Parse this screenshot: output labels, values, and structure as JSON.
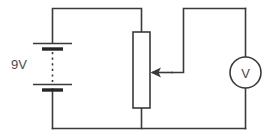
{
  "diagram": {
    "background_color": "#ffffff",
    "line_color": "#3a3a3a",
    "text_color": "#4a4a4a",
    "width": 275,
    "height": 139
  },
  "components": {
    "battery": {
      "name": "battery",
      "label": "9V",
      "symbol": "multi-cell-battery",
      "cells": 2
    },
    "potentiometer": {
      "name": "potentiometer",
      "label": "",
      "symbol": "rectangular-resistor-with-wiper",
      "wiper_direction": "left"
    },
    "voltmeter": {
      "name": "voltmeter",
      "label": "V",
      "symbol": "circle-meter"
    }
  },
  "wires": [
    {
      "name": "top-left-wire",
      "from": "battery-positive",
      "to": "potentiometer-top"
    },
    {
      "name": "wiper-wire",
      "from": "potentiometer-wiper",
      "to": "voltmeter-top"
    },
    {
      "name": "bottom-wire",
      "from": "battery-negative",
      "to": "voltmeter-bottom"
    },
    {
      "name": "potentiometer-bottom-wire",
      "from": "potentiometer-bottom",
      "to": "bottom-wire"
    }
  ]
}
